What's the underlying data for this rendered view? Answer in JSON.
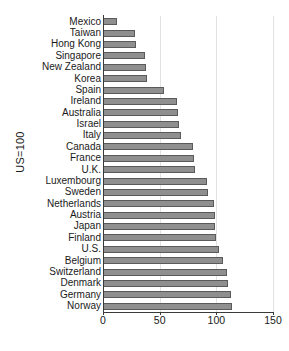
{
  "chart_data": {
    "type": "bar",
    "orientation": "horizontal",
    "title": "",
    "xlabel": "",
    "ylabel": "US=100",
    "xlim": [
      0,
      150
    ],
    "ylim": null,
    "xticks": [
      0,
      50,
      100,
      150
    ],
    "xtick_labels": [
      "0",
      "50",
      "100",
      "150"
    ],
    "grid": "vertical",
    "legend": null,
    "bar_color": "#8f8f8f",
    "bar_edge_color": "#5a5a5a",
    "grid_color": "#e2e2e2",
    "axis_color": "#3a3a3a",
    "categories": [
      "Mexico",
      "Taiwan",
      "Hong Kong",
      "Singapore",
      "New Zealand",
      "Korea",
      "Spain",
      "Ireland",
      "Australia",
      "Israel",
      "Italy",
      "Canada",
      "France",
      "U.K.",
      "Luxembourg",
      "Sweden",
      "Netherlands",
      "Austria",
      "Japan",
      "Finland",
      "U.S.",
      "Belgium",
      "Switzerland",
      "Denmark",
      "Germany",
      "Norway"
    ],
    "values": [
      12,
      28,
      29,
      37,
      38,
      39,
      54,
      65,
      66,
      67,
      69,
      79,
      80,
      81,
      92,
      93,
      98,
      99,
      99,
      100,
      102,
      106,
      109,
      110,
      113,
      114
    ]
  }
}
